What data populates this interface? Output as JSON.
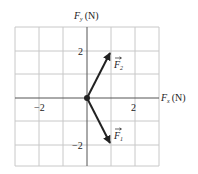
{
  "diagram": {
    "type": "force-vector-diagram",
    "axes": {
      "x_label_main": "F",
      "x_label_sub": "x",
      "x_label_unit": "(N)",
      "y_label_main": "F",
      "y_label_sub": "y",
      "y_label_unit": "(N)",
      "x_ticks": [
        {
          "value": -2,
          "label": "−2"
        },
        {
          "value": 2,
          "label": "2"
        }
      ],
      "y_ticks": [
        {
          "value": 2,
          "label": "2"
        },
        {
          "value": -2,
          "label": "−2"
        }
      ],
      "range": [
        -3,
        3
      ]
    },
    "vectors": [
      {
        "name": "F2",
        "label_main": "F",
        "label_sub": "2",
        "from": [
          0,
          0
        ],
        "to": [
          1,
          2
        ]
      },
      {
        "name": "F1",
        "label_main": "F",
        "label_sub": "1",
        "from": [
          0,
          0
        ],
        "to": [
          1,
          -2
        ]
      }
    ],
    "colors": {
      "grid": "#c8c8c8",
      "axis": "#555555",
      "vector": "#222222"
    }
  }
}
